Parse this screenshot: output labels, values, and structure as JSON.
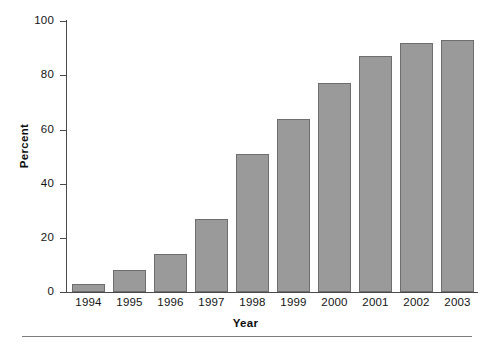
{
  "chart_data": {
    "type": "bar",
    "title": "",
    "subtitle": "",
    "xlabel": "Year",
    "ylabel": "Percent",
    "categories": [
      "1994",
      "1995",
      "1996",
      "1997",
      "1998",
      "1999",
      "2000",
      "2001",
      "2002",
      "2003"
    ],
    "values": [
      3,
      8,
      14,
      27,
      51,
      64,
      77,
      87,
      92,
      93
    ],
    "series": [
      {
        "name": "Percent",
        "values": [
          3,
          8,
          14,
          27,
          51,
          64,
          77,
          87,
          92,
          93
        ]
      }
    ],
    "ylim": [
      0,
      100
    ],
    "yticks": [
      0,
      20,
      40,
      60,
      80,
      100
    ],
    "ytick_labels": [
      "0",
      "20",
      "40",
      "60",
      "80",
      "100"
    ],
    "grid": false,
    "legend": false,
    "legend_position": "none",
    "bar_color": "#9a9a9a",
    "bar_edge_color": "#6e6e6e",
    "axis_color": "#4a4a4a",
    "text_color": "#141414",
    "annotations": []
  },
  "figure": {
    "background": "#ffffff",
    "footer_rule_color": "#7d7d7d"
  }
}
